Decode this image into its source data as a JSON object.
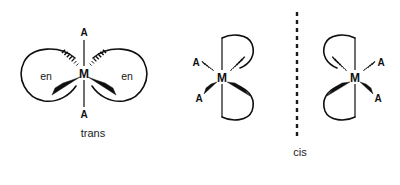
{
  "figure": {
    "background_color": "#ffffff",
    "ink_color": "#0f0f0f",
    "width": 400,
    "height": 185
  },
  "structures": [
    {
      "id": "trans",
      "isomer_label": "trans",
      "metal_label": "M",
      "metal_position": {
        "x": 84,
        "y": 73
      },
      "isomer_label_position": {
        "x": 93,
        "y": 134
      },
      "axial_ligands": [
        {
          "label": "A",
          "position": {
            "x": 84,
            "y": 32
          },
          "bond": "plain",
          "orientation": "up"
        },
        {
          "label": "A",
          "position": {
            "x": 84,
            "y": 114
          },
          "bond": "plain",
          "orientation": "down"
        }
      ],
      "chelates": [
        {
          "label": "en",
          "position": {
            "x": 46,
            "y": 76
          },
          "side": "left",
          "bonds": [
            "hash",
            "wedge"
          ]
        },
        {
          "label": "en",
          "position": {
            "x": 127,
            "y": 76
          },
          "side": "right",
          "bonds": [
            "hash",
            "wedge"
          ]
        }
      ]
    },
    {
      "id": "cis-left",
      "isomer_label": "",
      "metal_label": "M",
      "metal_position": {
        "x": 222,
        "y": 77
      },
      "monodentate_ligands": [
        {
          "label": "A",
          "position": {
            "x": 197,
            "y": 63
          },
          "bond": "hash",
          "direction": "upper-left"
        },
        {
          "label": "A",
          "position": {
            "x": 200,
            "y": 98
          },
          "bond": "wedge",
          "direction": "lower-left"
        }
      ],
      "chelates": [
        {
          "label": "",
          "side": "upper-right",
          "bonds": [
            "hash"
          ]
        },
        {
          "label": "",
          "side": "lower-right",
          "bonds": [
            "wedge"
          ]
        }
      ]
    },
    {
      "id": "cis-right",
      "isomer_label": "cis",
      "metal_label": "M",
      "metal_position": {
        "x": 355,
        "y": 77
      },
      "isomer_label_position": {
        "x": 300,
        "y": 153
      },
      "monodentate_ligands": [
        {
          "label": "A",
          "position": {
            "x": 380,
            "y": 63
          },
          "bond": "hash",
          "direction": "upper-right"
        },
        {
          "label": "A",
          "position": {
            "x": 377,
            "y": 98
          },
          "bond": "wedge",
          "direction": "lower-right"
        }
      ],
      "chelates": [
        {
          "label": "",
          "side": "upper-left",
          "bonds": [
            "hash"
          ]
        },
        {
          "label": "",
          "side": "lower-left",
          "bonds": [
            "wedge"
          ]
        }
      ]
    }
  ],
  "divider": {
    "style": "vertical-dashed",
    "x": 297,
    "y_start": 12,
    "y_end": 137,
    "color": "#1a1a1a"
  }
}
